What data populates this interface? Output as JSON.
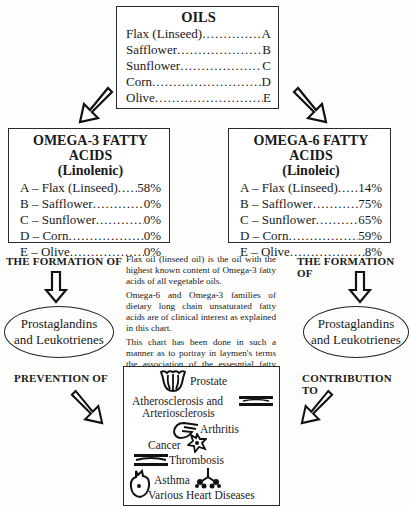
{
  "oils_box": {
    "title": "OILS",
    "items": [
      {
        "name": "Flax (Linseed)",
        "code": "A"
      },
      {
        "name": "Safflower",
        "code": "B"
      },
      {
        "name": "Sunflower",
        "code": "C"
      },
      {
        "name": "Corn",
        "code": "D"
      },
      {
        "name": "Olive",
        "code": "E"
      }
    ]
  },
  "omega3_box": {
    "title": "OMEGA-3 FATTY ACIDS",
    "subtitle": "(Linolenic)",
    "items": [
      {
        "label": "A – Flax (Linseed)",
        "value": "58%"
      },
      {
        "label": "B – Safflower",
        "value": "0%"
      },
      {
        "label": "C – Sunflower",
        "value": "0%"
      },
      {
        "label": "D – Corn",
        "value": "0%"
      },
      {
        "label": "E – Olive",
        "value": "0%"
      }
    ]
  },
  "omega6_box": {
    "title": "OMEGA-6 FATTY ACIDS",
    "subtitle": "(Linoleic)",
    "items": [
      {
        "label": "A – Flax (Linseed)",
        "value": "14%"
      },
      {
        "label": "B – Safflower",
        "value": "75%"
      },
      {
        "label": "C – Sunflower",
        "value": "65%"
      },
      {
        "label": "D – Corn",
        "value": "59%"
      },
      {
        "label": "E – Olive",
        "value": "8%"
      }
    ]
  },
  "left": {
    "formation_label": "THE FORMATION OF",
    "ellipse_line1": "Prostaglandins",
    "ellipse_line2": "and Leukotrienes",
    "effect_label": "PREVENTION OF"
  },
  "right": {
    "formation_label": "THE FORMATION OF",
    "ellipse_line1": "Prostaglandins",
    "ellipse_line2": "and Leukotrienes",
    "effect_label": "CONTRIBUTION TO"
  },
  "description": {
    "paragraphs": [
      "Flax oil (linseed oil) is the oil with the highest known content of Omega-3 fatty acids of all vegetable oils.",
      "Omega-6 and Omega-3 families of dietary long chain unsaturated fatty acids are of clinical interest as explained in this chart.",
      "This chart has been done in such a manner as to portray in laymen's terms the association of the essesntial fatty acids and their relation to human diseases."
    ]
  },
  "diseases_box": {
    "items": [
      {
        "label": "Prostate",
        "icon": "prostate-icon"
      },
      {
        "label": "Atherosclerosis and",
        "icon": "artery-icon"
      },
      {
        "label": "Arteriosclerosis"
      },
      {
        "label": "Arthritis",
        "icon": "hand-icon"
      },
      {
        "label": "Cancer",
        "icon": "cancer-cell-icon"
      },
      {
        "label": "Thrombosis",
        "icon": "clot-vessel-icon"
      },
      {
        "label": "Asthma",
        "icon": "lungs-icon"
      },
      {
        "label": "Various Heart Diseases",
        "icon": "heart-icon"
      }
    ]
  }
}
